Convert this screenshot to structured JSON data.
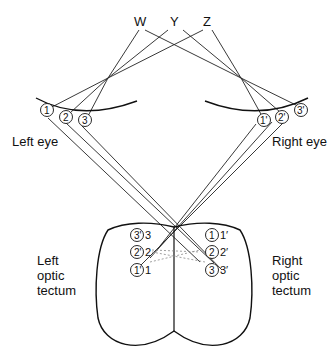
{
  "points": [
    {
      "id": "W",
      "label": "W",
      "x": 139,
      "y": 26
    },
    {
      "id": "Y",
      "label": "Y",
      "x": 175,
      "y": 26
    },
    {
      "id": "Z",
      "label": "Z",
      "x": 209,
      "y": 26
    }
  ],
  "eyes": {
    "left": {
      "label": "Left eye",
      "retina": [
        "①",
        "②",
        "③"
      ]
    },
    "right": {
      "label": "Right eye",
      "retina": [
        "①'",
        "②'",
        "③'"
      ]
    }
  },
  "tecta": {
    "left": {
      "label_lines": [
        "Left",
        "optic",
        "tectum"
      ],
      "entries": [
        {
          "circle": "③'",
          "num": "3"
        },
        {
          "circle": "②'",
          "num": "2"
        },
        {
          "circle": "①'",
          "num": "1"
        }
      ]
    },
    "right": {
      "label_lines": [
        "Right",
        "optic",
        "tectum"
      ],
      "entries": [
        {
          "circle": "①",
          "num": "1'"
        },
        {
          "circle": "②",
          "num": "2'"
        },
        {
          "circle": "③",
          "num": "3'"
        }
      ]
    }
  },
  "labels": {
    "W": "W",
    "Y": "Y",
    "Z": "Z",
    "left_eye": "Left eye",
    "right_eye": "Right eye",
    "lt1": "Left",
    "lt2": "optic",
    "lt3": "tectum",
    "rt1": "Right",
    "rt2": "optic",
    "rt3": "tectum",
    "c1": "1",
    "c2": "2",
    "c3": "3",
    "c1p": "1'",
    "c2p": "2'",
    "c3p": "3'",
    "n3": "3",
    "n2": "2",
    "n1": "1",
    "n1p": "1′",
    "n2p": "2′",
    "n3p": "3′"
  }
}
